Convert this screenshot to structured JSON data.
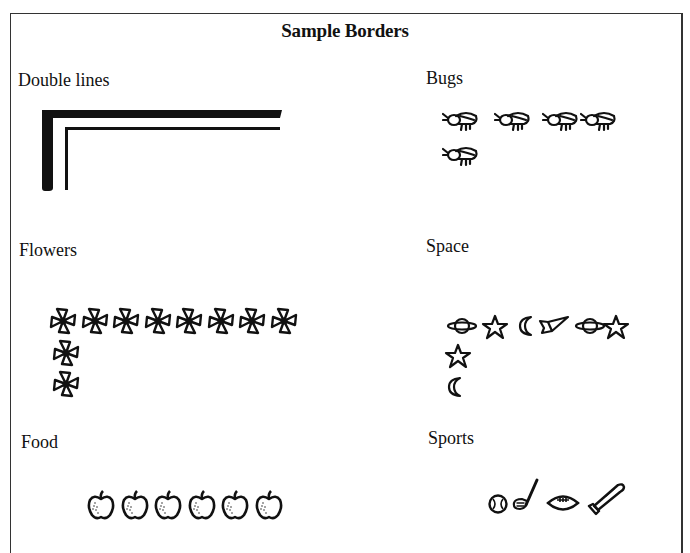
{
  "document": {
    "title": "Sample Borders",
    "sections": [
      {
        "id": "double-lines",
        "label": "Double lines",
        "pattern": "double-line-corner"
      },
      {
        "id": "bugs",
        "label": "Bugs",
        "icon": "bug-icon",
        "top_row_count": 4,
        "column_count": 1
      },
      {
        "id": "flowers",
        "label": "Flowers",
        "icon": "flower-icon",
        "top_row_count": 8,
        "column_count": 2
      },
      {
        "id": "space",
        "label": "Space",
        "icons_top_row": [
          "planet-icon",
          "star-icon",
          "moon-icon",
          "rocket-icon",
          "planet-icon",
          "star-icon"
        ],
        "icons_column": [
          "star-icon",
          "moon-icon"
        ]
      },
      {
        "id": "food",
        "label": "Food",
        "icon": "apple-icon",
        "top_row_count": 6
      },
      {
        "id": "sports",
        "label": "Sports",
        "icons_top_row": [
          "baseball-icon",
          "golf-club-icon",
          "football-icon",
          "baseball-bat-icon"
        ]
      }
    ]
  }
}
